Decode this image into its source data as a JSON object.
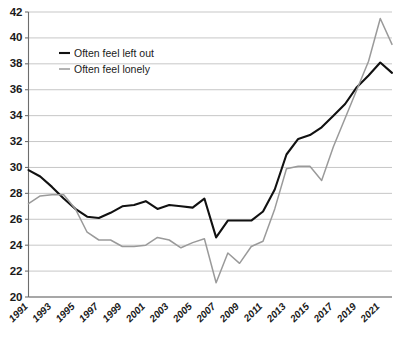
{
  "chart_data": {
    "type": "line",
    "title": "",
    "subtitle": "",
    "xlabel": "",
    "ylabel": "",
    "xlim": [
      1991,
      2022
    ],
    "ylim": [
      20,
      42
    ],
    "ytick_step": 2,
    "yticks": [
      20,
      22,
      24,
      26,
      28,
      30,
      32,
      34,
      36,
      38,
      40,
      42
    ],
    "xticks": [
      1991,
      1993,
      1995,
      1997,
      1999,
      2001,
      2003,
      2005,
      2007,
      2009,
      2011,
      2013,
      2015,
      2017,
      2019,
      2021
    ],
    "xtick_labels": [
      "1991",
      "1993",
      "1995",
      "1997",
      "1999",
      "2001",
      "2003",
      "2005",
      "2007",
      "2009",
      "2011",
      "2013",
      "2015",
      "2017",
      "2019",
      "2021"
    ],
    "grid": "horizontal",
    "legend_position": "top-left-inside",
    "x": [
      1991,
      1992,
      1993,
      1994,
      1995,
      1996,
      1997,
      1998,
      1999,
      2000,
      2001,
      2002,
      2003,
      2004,
      2005,
      2006,
      2007,
      2008,
      2009,
      2010,
      2011,
      2012,
      2013,
      2014,
      2015,
      2016,
      2017,
      2018,
      2019,
      2020,
      2021,
      2022
    ],
    "series": [
      {
        "name": "Often feel left out",
        "color": "#111111",
        "values": [
          29.8,
          29.3,
          28.5,
          27.6,
          26.8,
          26.2,
          26.1,
          26.5,
          27.0,
          27.1,
          27.4,
          26.8,
          27.1,
          27.0,
          26.9,
          27.6,
          24.6,
          25.9,
          25.9,
          25.9,
          26.6,
          28.3,
          31.0,
          32.2,
          32.5,
          33.1,
          34.0,
          34.9,
          36.2,
          37.1,
          38.1,
          37.3
        ]
      },
      {
        "name": "Often feel lonely",
        "color": "#9a9a9a",
        "values": [
          27.2,
          27.8,
          27.9,
          27.9,
          26.8,
          25.0,
          24.4,
          24.4,
          23.9,
          23.9,
          24.0,
          24.6,
          24.4,
          23.8,
          24.2,
          24.5,
          21.1,
          23.4,
          22.6,
          23.9,
          24.3,
          26.8,
          29.9,
          30.1,
          30.1,
          29.0,
          31.6,
          33.8,
          36.0,
          38.2,
          41.5,
          39.5
        ]
      }
    ]
  },
  "legend": {
    "items": [
      {
        "label": "Often feel left out",
        "color": "#111111"
      },
      {
        "label": "Often feel lonely",
        "color": "#9a9a9a"
      }
    ]
  }
}
